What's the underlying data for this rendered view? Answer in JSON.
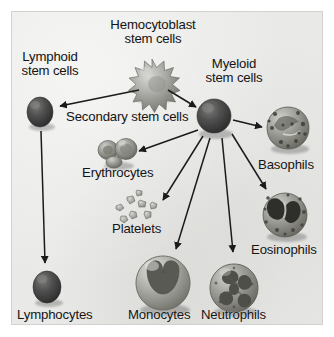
{
  "figure": {
    "background_color": "#e9e9e7",
    "border_color": "#d2d2d0",
    "ink_color": "#141414",
    "width": 334,
    "height": 337
  },
  "labels": {
    "hemocytoblast": "Hemocytoblast\nstem cells",
    "lymphoid": "Lymphoid\nstem cells",
    "myeloid": "Myeloid\nstem cells",
    "secondary": "Secondary stem cells",
    "erythrocytes": "Erythrocytes",
    "platelets": "Platelets",
    "basophils": "Basophils",
    "eosinophils": "Eosinophils",
    "lymphocytes": "Lymphocytes",
    "monocytes": "Monocytes",
    "neutrophils": "Neutrophils"
  },
  "cells": [
    {
      "id": "hemocytoblast",
      "name": "hemocytoblast-stem-cell",
      "shape": "spiky-star-cell",
      "cx": 152,
      "cy": 79,
      "r": 19,
      "fill": "#9a9a96"
    },
    {
      "id": "lymphoid-stem",
      "name": "lymphoid-stem-cell",
      "shape": "dark-oval-cell",
      "cx": 40,
      "cy": 112,
      "r": 15,
      "fill": "#4f4f4d"
    },
    {
      "id": "myeloid-stem",
      "name": "myeloid-stem-cell",
      "shape": "dark-round-cell",
      "cx": 214,
      "cy": 116,
      "r": 18,
      "fill": "#4a4a48"
    },
    {
      "id": "erythrocytes",
      "name": "erythrocyte-cluster",
      "shape": "biconcave-discs",
      "cx": 117,
      "cy": 152,
      "r": 14,
      "fill": "#8e8e8a"
    },
    {
      "id": "basophils",
      "name": "basophil-cell",
      "shape": "granular-cell",
      "cx": 288,
      "cy": 128,
      "r": 21,
      "fill": "#8a8a86"
    },
    {
      "id": "eosinophils",
      "name": "eosinophil-cell",
      "shape": "bilobed-granular-cell",
      "cx": 285,
      "cy": 215,
      "r": 22,
      "fill": "#9a9a96"
    },
    {
      "id": "platelets",
      "name": "platelet-fragments",
      "shape": "small-fragments",
      "cx": 133,
      "cy": 210,
      "r": 16,
      "fill": "#a8a8a4"
    },
    {
      "id": "lymphocytes",
      "name": "lymphocyte-cell",
      "shape": "dark-oval-cell",
      "cx": 47,
      "cy": 287,
      "r": 16,
      "fill": "#4f4f4d"
    },
    {
      "id": "monocytes",
      "name": "monocyte-cell",
      "shape": "kidney-nucleus-cell",
      "cx": 163,
      "cy": 283,
      "r": 27,
      "fill": "#9d9d99"
    },
    {
      "id": "neutrophils",
      "name": "neutrophil-cell",
      "shape": "lobed-nucleus-cell",
      "cx": 234,
      "cy": 288,
      "r": 24,
      "fill": "#a0a09c"
    }
  ],
  "arrows": [
    {
      "name": "arrow-hemocytoblast-to-lymphoid",
      "from": "hemocytoblast",
      "to": "lymphoid-stem",
      "x1": 139,
      "y1": 90,
      "x2": 60,
      "y2": 106
    },
    {
      "name": "arrow-hemocytoblast-to-myeloid",
      "from": "hemocytoblast",
      "to": "myeloid-stem",
      "x1": 168,
      "y1": 90,
      "x2": 196,
      "y2": 107
    },
    {
      "name": "arrow-lymphoid-to-lymphocytes",
      "from": "lymphoid-stem",
      "to": "lymphocytes",
      "x1": 41,
      "y1": 131,
      "x2": 45,
      "y2": 263
    },
    {
      "name": "arrow-myeloid-to-erythrocytes",
      "from": "myeloid-stem",
      "to": "erythrocytes",
      "x1": 198,
      "y1": 130,
      "x2": 139,
      "y2": 151
    },
    {
      "name": "arrow-myeloid-to-basophils",
      "from": "myeloid-stem",
      "to": "basophils",
      "x1": 233,
      "y1": 120,
      "x2": 262,
      "y2": 127
    },
    {
      "name": "arrow-myeloid-to-platelets",
      "from": "myeloid-stem",
      "to": "platelets",
      "x1": 203,
      "y1": 136,
      "x2": 163,
      "y2": 200
    },
    {
      "name": "arrow-myeloid-to-monocytes",
      "from": "myeloid-stem",
      "to": "monocytes",
      "x1": 210,
      "y1": 138,
      "x2": 176,
      "y2": 249
    },
    {
      "name": "arrow-myeloid-to-neutrophils",
      "from": "myeloid-stem",
      "to": "neutrophils",
      "x1": 222,
      "y1": 138,
      "x2": 233,
      "y2": 252
    },
    {
      "name": "arrow-myeloid-to-eosinophils",
      "from": "myeloid-stem",
      "to": "eosinophils",
      "x1": 232,
      "y1": 134,
      "x2": 266,
      "y2": 189
    }
  ]
}
